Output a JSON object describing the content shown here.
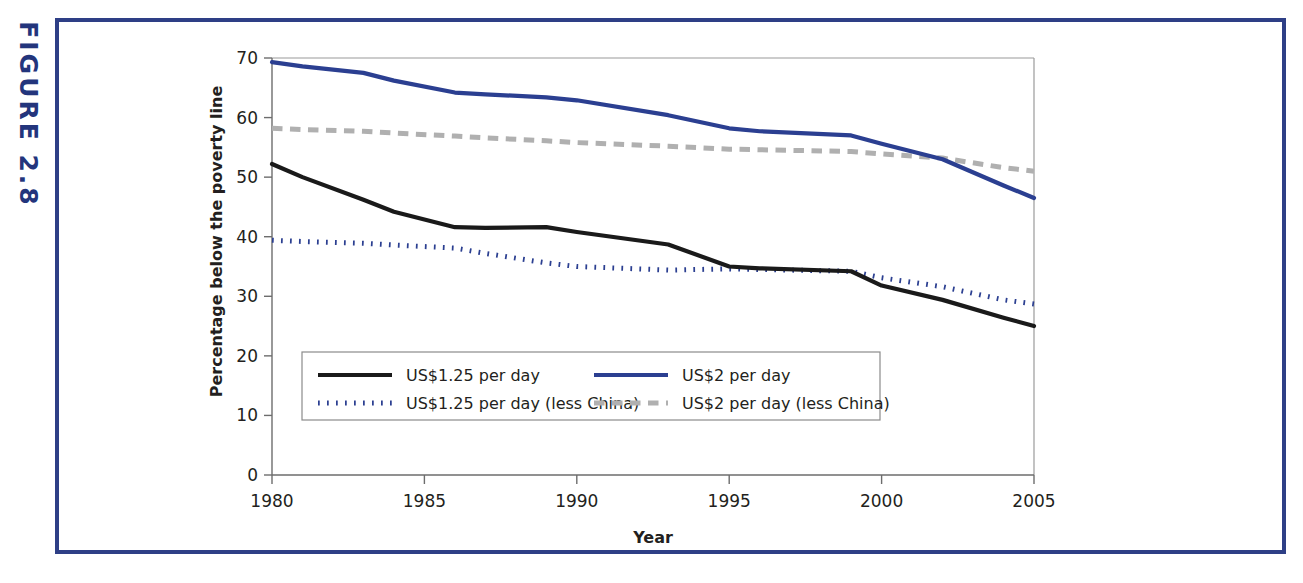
{
  "figure": {
    "label": "FIGURE 2.8",
    "frame_color": "#2e3f86"
  },
  "chart_data": {
    "type": "line",
    "title": "",
    "xlabel": "Year",
    "ylabel": "Percentage below the poverty line",
    "xlim": [
      1980,
      2005
    ],
    "ylim": [
      0,
      70
    ],
    "xticks": [
      "1980",
      "1985",
      "1990",
      "1995",
      "2000",
      "2005"
    ],
    "yticks": [
      "0",
      "10",
      "20",
      "30",
      "40",
      "50",
      "60",
      "70"
    ],
    "grid": false,
    "legend_position": "lower-left-inside",
    "x": [
      1980,
      1981,
      1983,
      1984,
      1986,
      1987,
      1989,
      1990,
      1993,
      1995,
      1996,
      1999,
      2000,
      2002,
      2004,
      2005
    ],
    "series": [
      {
        "name": "US$1.25 per day",
        "style": "solid",
        "color": "#1a1a1a",
        "values": [
          52.2,
          50.0,
          46.2,
          44.2,
          41.6,
          41.5,
          41.6,
          40.8,
          38.7,
          35.0,
          34.7,
          34.2,
          31.8,
          29.4,
          26.4,
          25.0
        ]
      },
      {
        "name": "US$2 per day",
        "style": "solid",
        "color": "#2b3f91",
        "values": [
          69.3,
          68.6,
          67.5,
          66.2,
          64.2,
          63.9,
          63.4,
          62.9,
          60.4,
          58.2,
          57.7,
          57.0,
          55.6,
          53.0,
          48.6,
          46.5
        ]
      },
      {
        "name": "US$1.25 per day (less China)",
        "style": "dotted",
        "color": "#2b3f91",
        "values": [
          39.4,
          39.2,
          38.9,
          38.6,
          38.1,
          37.2,
          35.6,
          35.0,
          34.4,
          34.6,
          34.5,
          34.2,
          33.1,
          31.6,
          29.4,
          28.7
        ]
      },
      {
        "name": "US$2 per day (less China)",
        "style": "dashdot",
        "color": "#b0b0b0",
        "values": [
          58.2,
          58.0,
          57.7,
          57.4,
          56.9,
          56.6,
          56.1,
          55.8,
          55.2,
          54.7,
          54.6,
          54.3,
          53.9,
          53.2,
          51.6,
          51.0
        ]
      }
    ]
  },
  "legend": {
    "items": [
      {
        "label": "US$1.25 per day",
        "style": "solid",
        "color": "#1a1a1a"
      },
      {
        "label": "US$2 per day",
        "style": "solid",
        "color": "#2b3f91"
      },
      {
        "label": "US$1.25 per day (less China)",
        "style": "dotted",
        "color": "#2b3f91"
      },
      {
        "label": "US$2 per day (less China)",
        "style": "dashdot",
        "color": "#b0b0b0"
      }
    ]
  }
}
